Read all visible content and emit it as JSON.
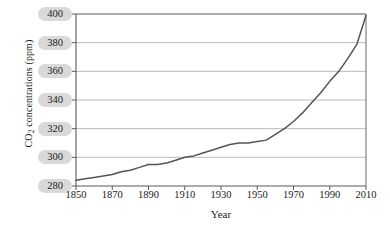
{
  "chart_data": {
    "type": "line",
    "title": "",
    "xlabel": "Year",
    "ylabel": "CO2 concentrations (ppm)",
    "ylabel_parts": {
      "prefix": "CO",
      "sub": "2",
      "suffix": " concentrations (ppm)"
    },
    "xlim": [
      1850,
      2010
    ],
    "ylim": [
      280,
      400
    ],
    "xticks": [
      1850,
      1870,
      1890,
      1910,
      1930,
      1950,
      1970,
      1990,
      2010
    ],
    "yticks": [
      280,
      300,
      320,
      340,
      360,
      380,
      400
    ],
    "grid": "horizontal",
    "legend": "none",
    "series": [
      {
        "name": "CO2 concentration",
        "color": "#555555",
        "x": [
          1850,
          1855,
          1860,
          1865,
          1870,
          1875,
          1880,
          1885,
          1890,
          1895,
          1900,
          1905,
          1910,
          1915,
          1920,
          1925,
          1930,
          1935,
          1940,
          1945,
          1950,
          1955,
          1960,
          1965,
          1970,
          1975,
          1980,
          1985,
          1990,
          1995,
          2000,
          2005,
          2010
        ],
        "values": [
          284,
          285,
          286,
          287,
          288,
          290,
          291,
          293,
          295,
          295,
          296,
          298,
          300,
          301,
          303,
          305,
          307,
          309,
          310,
          310,
          311,
          312,
          316,
          320,
          325,
          331,
          338,
          345,
          353,
          360,
          369,
          379,
          399
        ]
      }
    ],
    "axis_color": "#5a5a5a",
    "grid_color": "#b3b3b3",
    "tick_pill_color": "#d9d9d9",
    "plot_bg": "#ffffff"
  }
}
